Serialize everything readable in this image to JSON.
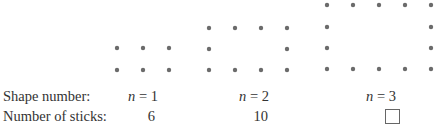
{
  "row_labels": {
    "shape_number": "Shape number:",
    "number_of_sticks": "Number of sticks:"
  },
  "dot_color": "#6b6b6b",
  "shapes": [
    {
      "n_var": "n",
      "n_eq": "= 1",
      "sticks": "6",
      "rows": 2,
      "cols": 3,
      "xs": [
        117,
        143,
        169
      ],
      "ys": [
        48,
        70
      ]
    },
    {
      "n_var": "n",
      "n_eq": "= 2",
      "sticks": "10",
      "rows": 3,
      "cols": 4,
      "xs": [
        209,
        235,
        261,
        287
      ],
      "ys": [
        28,
        49,
        70
      ]
    },
    {
      "n_var": "n",
      "n_eq": "=  3",
      "sticks": "",
      "sticks_is_blank_box": true,
      "rows": 4,
      "cols": 5,
      "xs": [
        327,
        353,
        379,
        405,
        431
      ],
      "ys": [
        5,
        27,
        48,
        69
      ]
    }
  ]
}
